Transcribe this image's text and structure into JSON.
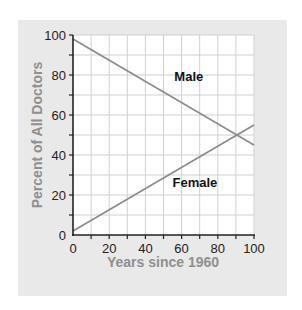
{
  "chart_data": {
    "type": "line",
    "title": "",
    "xlabel": "Years since 1960",
    "ylabel": "Percent of All Doctors",
    "xlim": [
      0,
      100
    ],
    "ylim": [
      0,
      100
    ],
    "x_ticks": [
      0,
      20,
      40,
      60,
      80,
      100
    ],
    "y_ticks": [
      0,
      20,
      40,
      60,
      80,
      100
    ],
    "grid": true,
    "legend": "inline labels",
    "series": [
      {
        "name": "Male",
        "x": [
          0,
          100
        ],
        "values": [
          98,
          45
        ],
        "label_pos": {
          "x": 56,
          "y": 77
        }
      },
      {
        "name": "Female",
        "x": [
          0,
          100
        ],
        "values": [
          2,
          55
        ],
        "label_pos": {
          "x": 55,
          "y": 24
        }
      }
    ],
    "annotations": [
      "Lines intersect near x=90, y=50"
    ]
  },
  "colors": {
    "panel_bg": "#e9e9e9",
    "plot_bg": "#ffffff",
    "grid": "#d0d0d0",
    "line": "#8a8a8a",
    "axis_title": "#8f8f8f"
  }
}
